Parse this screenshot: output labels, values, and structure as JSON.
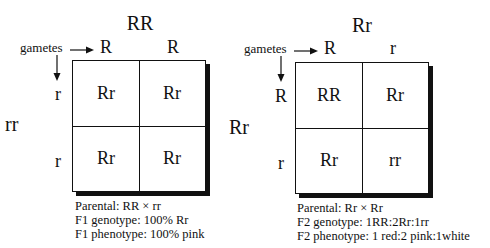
{
  "diagrams": [
    {
      "parent_top": "RR",
      "parent_side": "rr",
      "gametes_label": "gametes",
      "top_gametes": [
        "R",
        "R"
      ],
      "side_gametes": [
        "r",
        "r"
      ],
      "cells": [
        [
          "Rr",
          "Rr"
        ],
        [
          "Rr",
          "Rr"
        ]
      ],
      "caption": {
        "line1": "Parental: RR × rr",
        "line2": "F1 genotype: 100% Rr",
        "line3": "F1 phenotype: 100% pink"
      }
    },
    {
      "parent_top": "Rr",
      "parent_side": "Rr",
      "gametes_label": "gametes",
      "top_gametes": [
        "R",
        "r"
      ],
      "side_gametes": [
        "R",
        "r"
      ],
      "cells": [
        [
          "RR",
          "Rr"
        ],
        [
          "Rr",
          "rr"
        ]
      ],
      "caption": {
        "line1": "Parental: Rr × Rr",
        "line2": "F2 genotype: 1RR:2Rr:1rr",
        "line3": "F2 phenotype: 1 red:2 pink:1white"
      }
    }
  ]
}
